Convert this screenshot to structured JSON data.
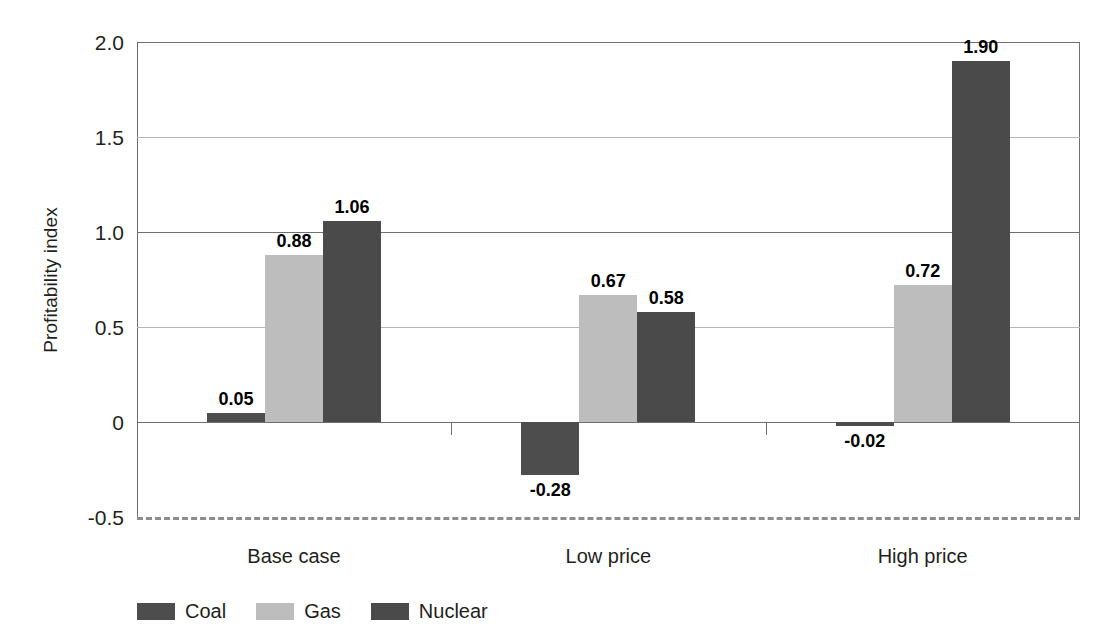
{
  "chart_data": {
    "type": "bar",
    "title": "",
    "xlabel": "",
    "ylabel": "Profitability index",
    "categories": [
      "Base case",
      "Low price",
      "High price"
    ],
    "series": [
      {
        "name": "Coal",
        "color": "#4d4d4d",
        "values": [
          0.05,
          -0.28,
          -0.02
        ],
        "labels": [
          "0.05",
          "-0.28",
          "-0.02"
        ]
      },
      {
        "name": "Gas",
        "color": "#bdbdbd",
        "values": [
          0.88,
          0.67,
          0.72
        ],
        "labels": [
          "0.88",
          "0.67",
          "0.72"
        ]
      },
      {
        "name": "Nuclear",
        "color": "#4a4a4a",
        "values": [
          1.06,
          0.58,
          1.9
        ],
        "labels": [
          "1.06",
          "0.58",
          "1.90"
        ]
      }
    ],
    "ylim": [
      -0.5,
      2.0
    ],
    "yticks": [
      2.0,
      1.5,
      1.0,
      0.5,
      0,
      -0.5
    ],
    "ytick_labels": [
      "2.0",
      "1.5",
      "1.0",
      "0.5",
      "0",
      "-0.5"
    ],
    "grid": true,
    "legend_position": "bottom-left",
    "baseline": 0,
    "bottom_line_style": "dashed"
  },
  "legend": {
    "items": [
      {
        "label": "Coal",
        "color": "#4d4d4d"
      },
      {
        "label": "Gas",
        "color": "#bdbdbd"
      },
      {
        "label": "Nuclear",
        "color": "#4a4a4a"
      }
    ]
  },
  "axis": {
    "y_title": "Profitability index"
  }
}
